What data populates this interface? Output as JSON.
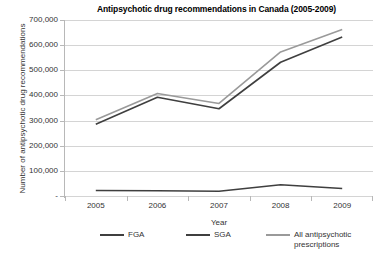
{
  "chart_data": {
    "type": "line",
    "title": "Antipsychotic drug recommendations in Canada (2005-2009)",
    "xlabel": "Year",
    "ylabel": "Number of antipsychotic drug recommendations",
    "categories": [
      "2005",
      "2006",
      "2007",
      "2008",
      "2009"
    ],
    "ylim": [
      0,
      700000
    ],
    "y_ticks": [
      0,
      100000,
      200000,
      300000,
      400000,
      500000,
      600000,
      700000
    ],
    "y_tick_labels": [
      "-",
      "100,000",
      "200,000",
      "300,000",
      "400,000",
      "500,000",
      "600,000",
      "700,000"
    ],
    "grid": true,
    "legend_position": "bottom",
    "series": [
      {
        "name": "FGA",
        "color": "#3f3f3f",
        "values": [
          22000,
          21000,
          19000,
          45000,
          30000
        ]
      },
      {
        "name": "SGA",
        "color": "#3f3f3f",
        "values": [
          285000,
          393000,
          347000,
          532000,
          632000
        ]
      },
      {
        "name": "All antipsychotic\nprescriptions",
        "color": "#9a9a9a",
        "values": [
          303000,
          408000,
          368000,
          573000,
          662000
        ]
      }
    ]
  }
}
